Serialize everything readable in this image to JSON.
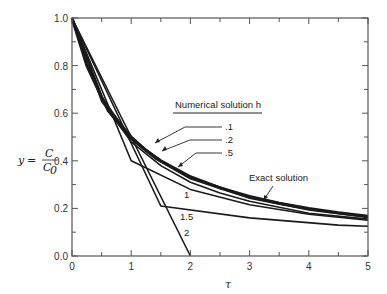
{
  "chart_data": {
    "type": "line",
    "title": "",
    "xlabel": "τ",
    "ylabel": "y = C / C0",
    "ylabel_parts": {
      "y": "y =",
      "num": "C",
      "den": "C",
      "sub": "0"
    },
    "xlim": [
      0,
      5
    ],
    "ylim": [
      0,
      1.0
    ],
    "xticks": [
      "0",
      "1",
      "2",
      "3",
      "4",
      "5"
    ],
    "yticks": [
      "0.0",
      "0.2",
      "0.4",
      "0.6",
      "0.8",
      "1.0"
    ],
    "grid": false,
    "legend_title": "Numerical solution h",
    "series": [
      {
        "name": "Exact solution",
        "label": "Exact solution",
        "width": 3,
        "x": [
          0,
          0.25,
          0.5,
          0.75,
          1,
          1.25,
          1.5,
          2,
          2.5,
          3,
          3.5,
          4,
          4.5,
          5
        ],
        "y": [
          1,
          0.8,
          0.667,
          0.571,
          0.5,
          0.444,
          0.4,
          0.333,
          0.286,
          0.25,
          0.222,
          0.2,
          0.182,
          0.167
        ]
      },
      {
        "name": "h=.1",
        "label": ".1",
        "width": 1.8,
        "x": [
          0,
          0.5,
          1,
          1.5,
          2,
          3,
          4,
          5
        ],
        "y": [
          1,
          0.665,
          0.497,
          0.397,
          0.331,
          0.248,
          0.198,
          0.165
        ]
      },
      {
        "name": "h=.2",
        "label": ".2",
        "width": 1.8,
        "x": [
          0,
          0.6,
          1,
          1.4,
          2,
          3,
          4,
          5
        ],
        "y": [
          1,
          0.61,
          0.49,
          0.41,
          0.325,
          0.243,
          0.194,
          0.162
        ]
      },
      {
        "name": "h=.5",
        "label": ".5",
        "width": 1.6,
        "x": [
          0,
          0.5,
          1,
          1.5,
          2,
          2.5,
          3,
          4,
          5
        ],
        "y": [
          1,
          0.65,
          0.48,
          0.38,
          0.31,
          0.265,
          0.23,
          0.18,
          0.155
        ]
      },
      {
        "name": "h=1",
        "label": "1",
        "width": 1.6,
        "x": [
          0,
          1,
          2,
          3,
          4,
          5
        ],
        "y": [
          1,
          0.4,
          0.28,
          0.215,
          0.175,
          0.15
        ]
      },
      {
        "name": "h=1.5",
        "label": "1.5",
        "width": 1.6,
        "x": [
          0,
          1.5,
          3,
          4.5,
          5
        ],
        "y": [
          1,
          0.21,
          0.16,
          0.13,
          0.125
        ]
      },
      {
        "name": "h=2",
        "label": "2",
        "width": 1.6,
        "x": [
          0,
          2
        ],
        "y": [
          1,
          0.0
        ]
      }
    ],
    "annotations": [
      {
        "text": "Numerical solution h",
        "points_to": "legend header"
      },
      {
        "text": "Exact solution",
        "points_to": "exact curve near τ=3.2"
      }
    ]
  }
}
